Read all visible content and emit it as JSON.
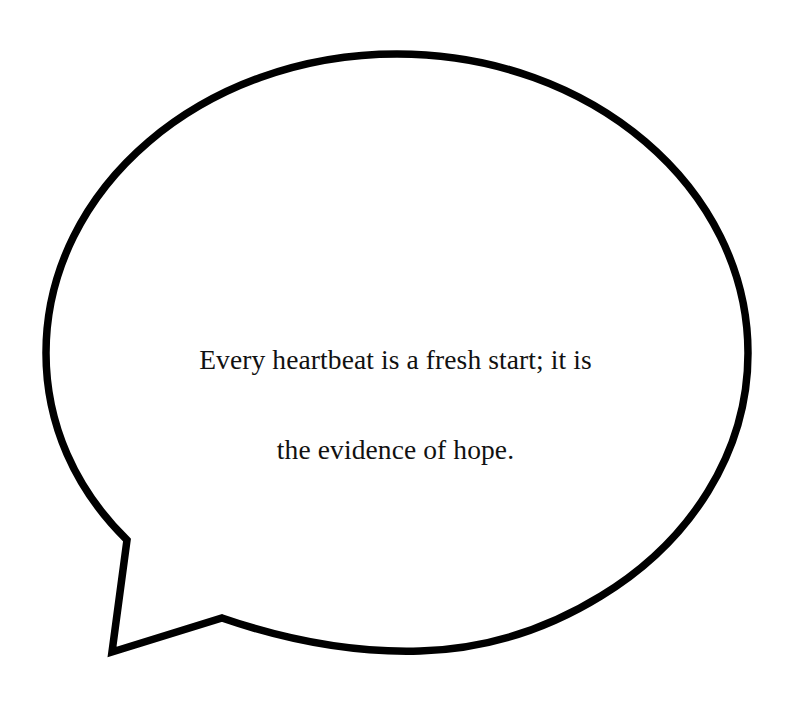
{
  "canvas": {
    "width": 791,
    "height": 704,
    "background_color": "#ffffff"
  },
  "bubble": {
    "shape": "speech-balloon-ellipse-with-pointed-tail",
    "stroke_color": "#000000",
    "fill_color": "#ffffff",
    "stroke_width": 7.5,
    "ellipse": {
      "center_x": 397,
      "center_y": 353,
      "radius_x": 351,
      "radius_y": 299
    },
    "tail": {
      "upper_join_x": 127,
      "upper_join_y": 540,
      "tip_x": 112,
      "tip_y": 652,
      "lower_join_x": 222,
      "lower_join_y": 618
    }
  },
  "quote": {
    "full_text": "Every heartbeat is a fresh start; it is the evidence of hope.",
    "lines": [
      "Every heartbeat is a fresh start; it is",
      "the evidence of hope."
    ],
    "text_color": "#111111",
    "alignment": "center"
  }
}
